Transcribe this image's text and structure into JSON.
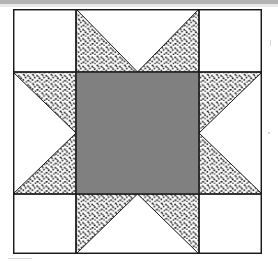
{
  "image": {
    "kind": "quilt-block-diagram",
    "title": "Sawtooth Star quilt block",
    "width_px": 278,
    "height_px": 261,
    "background_color": "#ffffff",
    "scan_band_color": "#b4b4b4"
  },
  "block": {
    "name": "Sawtooth Star",
    "origin_x": 13,
    "origin_y": 9,
    "width": 249,
    "height": 245,
    "outline_color": "#1a1a1a",
    "outline_width": 1.4,
    "grid_line_color": "#1a1a1a",
    "grid_line_width": 1.1,
    "grid_columns_px": [
      0,
      63,
      186,
      249
    ],
    "grid_rows_px": [
      0,
      63,
      185,
      245
    ],
    "fabrics": [
      {
        "id": "center",
        "label": "center square",
        "fill": "#808080",
        "style": "solid-gray"
      },
      {
        "id": "points",
        "label": "star points",
        "fill": "stipple",
        "style": "dotted-stipple"
      },
      {
        "id": "background",
        "label": "background",
        "fill": "#ffffff",
        "style": "plain-white"
      }
    ],
    "patches": [
      {
        "name": "corner-top-left",
        "fabric": "background",
        "shape": "square"
      },
      {
        "name": "corner-top-right",
        "fabric": "background",
        "shape": "square"
      },
      {
        "name": "corner-bottom-left",
        "fabric": "background",
        "shape": "square"
      },
      {
        "name": "corner-bottom-right",
        "fabric": "background",
        "shape": "square"
      },
      {
        "name": "star-point-top",
        "fabric": "points",
        "shape": "flying-geese",
        "orientation": "down"
      },
      {
        "name": "star-point-bottom",
        "fabric": "points",
        "shape": "flying-geese",
        "orientation": "up"
      },
      {
        "name": "star-point-left",
        "fabric": "points",
        "shape": "flying-geese",
        "orientation": "right"
      },
      {
        "name": "star-point-right",
        "fabric": "points",
        "shape": "flying-geese",
        "orientation": "left"
      },
      {
        "name": "center-square",
        "fabric": "center",
        "shape": "square"
      }
    ]
  },
  "stipple": {
    "dot_color": "#202020",
    "dot_size_px": 1.7,
    "spacing_px": 4.6,
    "background": "#ffffff"
  }
}
